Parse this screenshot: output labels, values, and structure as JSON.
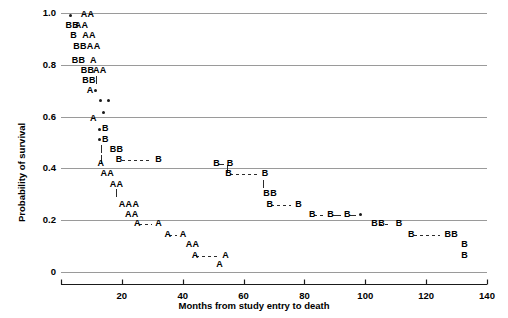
{
  "chart_data": {
    "type": "scatter",
    "title": "",
    "xlabel": "Months from study entry to death",
    "ylabel": "Probability of survival",
    "xlim": [
      0,
      140
    ],
    "ylim": [
      0,
      1.0
    ],
    "xticks": [
      20,
      40,
      60,
      80,
      100,
      120,
      140
    ],
    "xticklabels": [
      "20",
      "40",
      "60",
      "80",
      "100",
      "120",
      "140"
    ],
    "yticks": [
      0,
      0.2,
      0.4,
      0.6,
      0.8,
      1.0
    ],
    "yticklabels": [
      "0",
      "0.2",
      "0.4",
      "0.6",
      "0.8",
      "1.0"
    ],
    "grid": "horizontal",
    "legend": "none",
    "series": [
      {
        "name": "Group A",
        "marker": "A",
        "description": "Step-down survival curve labelled with the letter A, falling faster than group B",
        "points": [
          {
            "x": 6.5,
            "y": 0.975,
            "label": "AA"
          },
          {
            "x": 4.5,
            "y": 0.935,
            "label": "AA"
          },
          {
            "x": 7.0,
            "y": 0.895,
            "label": "AA"
          },
          {
            "x": 8.5,
            "y": 0.855,
            "label": "AA"
          },
          {
            "x": 9.5,
            "y": 0.8,
            "label": "A"
          },
          {
            "x": 10.5,
            "y": 0.762,
            "label": "AA"
          },
          {
            "x": 8.5,
            "y": 0.685,
            "label": "A"
          },
          {
            "x": 9.5,
            "y": 0.575,
            "label": "A"
          },
          {
            "x": 12.0,
            "y": 0.4,
            "label": "A"
          },
          {
            "x": 13.0,
            "y": 0.362,
            "label": "AA"
          },
          {
            "x": 16.0,
            "y": 0.322,
            "label": "AA"
          },
          {
            "x": 19.0,
            "y": 0.245,
            "label": "AAA"
          },
          {
            "x": 21.0,
            "y": 0.205,
            "label": "AA"
          },
          {
            "x": 24.0,
            "y": 0.168,
            "label": "A"
          },
          {
            "x": 31.0,
            "y": 0.168,
            "label": "A"
          },
          {
            "x": 34.0,
            "y": 0.128,
            "label": "A"
          },
          {
            "x": 39.0,
            "y": 0.128,
            "label": "A"
          },
          {
            "x": 41.0,
            "y": 0.088,
            "label": "AA"
          },
          {
            "x": 43.0,
            "y": 0.048,
            "label": "A"
          },
          {
            "x": 53.0,
            "y": 0.048,
            "label": "A"
          },
          {
            "x": 51.0,
            "y": 0.01,
            "label": "A"
          }
        ]
      },
      {
        "name": "Group B",
        "marker": "B",
        "description": "Step-down survival curve labelled with the letter B, surviving longer than group A",
        "points": [
          {
            "x": 1.5,
            "y": 0.935,
            "label": "BB"
          },
          {
            "x": 3.0,
            "y": 0.895,
            "label": "B"
          },
          {
            "x": 4.0,
            "y": 0.855,
            "label": "BB"
          },
          {
            "x": 3.5,
            "y": 0.8,
            "label": "BB"
          },
          {
            "x": 6.5,
            "y": 0.762,
            "label": "BB"
          },
          {
            "x": 7.0,
            "y": 0.722,
            "label": "BB"
          },
          {
            "x": 13.5,
            "y": 0.535,
            "label": "B"
          },
          {
            "x": 13.5,
            "y": 0.495,
            "label": "B"
          },
          {
            "x": 16.0,
            "y": 0.455,
            "label": "BB"
          },
          {
            "x": 18.0,
            "y": 0.418,
            "label": "B"
          },
          {
            "x": 31.0,
            "y": 0.418,
            "label": "B"
          },
          {
            "x": 50.0,
            "y": 0.4,
            "label": "B"
          },
          {
            "x": 54.5,
            "y": 0.4,
            "label": "B"
          },
          {
            "x": 54.0,
            "y": 0.362,
            "label": "B"
          },
          {
            "x": 66.0,
            "y": 0.362,
            "label": "B"
          },
          {
            "x": 66.5,
            "y": 0.285,
            "label": "BB"
          },
          {
            "x": 67.5,
            "y": 0.245,
            "label": "B"
          },
          {
            "x": 77.0,
            "y": 0.245,
            "label": "B"
          },
          {
            "x": 81.5,
            "y": 0.205,
            "label": "B"
          },
          {
            "x": 87.5,
            "y": 0.205,
            "label": "B"
          },
          {
            "x": 93.0,
            "y": 0.205,
            "label": "B"
          },
          {
            "x": 102.0,
            "y": 0.168,
            "label": "BB"
          },
          {
            "x": 110.0,
            "y": 0.168,
            "label": "B"
          },
          {
            "x": 114.0,
            "y": 0.128,
            "label": "B"
          },
          {
            "x": 126.0,
            "y": 0.128,
            "label": "BB"
          },
          {
            "x": 131.5,
            "y": 0.088,
            "label": "B"
          },
          {
            "x": 131.5,
            "y": 0.048,
            "label": "B"
          }
        ]
      },
      {
        "name": "Censored / combined",
        "marker": "dot",
        "description": "Filled round dots marking censored or overlapping observations",
        "points": [
          {
            "x": 3.0,
            "y": 0.975
          },
          {
            "x": 11.5,
            "y": 0.685
          },
          {
            "x": 13.0,
            "y": 0.645
          },
          {
            "x": 15.5,
            "y": 0.645
          },
          {
            "x": 14.0,
            "y": 0.6
          },
          {
            "x": 12.5,
            "y": 0.535
          },
          {
            "x": 12.5,
            "y": 0.495
          },
          {
            "x": 98.5,
            "y": 0.205
          }
        ]
      }
    ]
  },
  "axes": {
    "y_title": "Probability of survival",
    "x_title": "Months from study entry to death",
    "y_labels": [
      "1.0",
      "0.8",
      "0.6",
      "0.4",
      "0.2",
      "0"
    ],
    "x_labels": [
      "20",
      "40",
      "60",
      "80",
      "100",
      "120",
      "140"
    ]
  },
  "style": {
    "grid_color": "#9a9a9a",
    "axis_color": "#1a1a1a",
    "mark_color": "#1a1a1a",
    "background": "#ffffff"
  }
}
